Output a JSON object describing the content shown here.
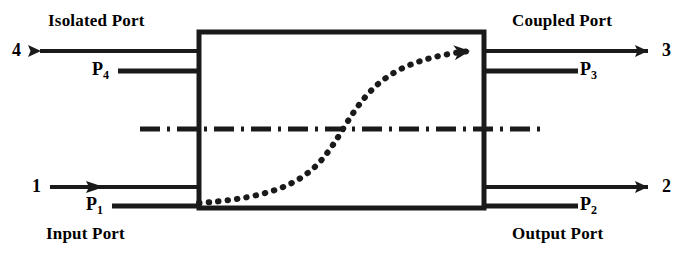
{
  "figure": {
    "colors": {
      "stroke": "#1a1a1a",
      "background": "#ffffff"
    }
  },
  "diagram": {
    "body_label": "coupler-body",
    "axis_label": "symmetry-axis",
    "coupling_label": "coupling-path"
  },
  "ports": {
    "isolated": {
      "name": "Isolated Port",
      "number": "4",
      "power": "P",
      "power_sub": "4"
    },
    "coupled": {
      "name": "Coupled Port",
      "number": "3",
      "power": "P",
      "power_sub": "3"
    },
    "input": {
      "name": "Input Port",
      "number": "1",
      "power": "P",
      "power_sub": "1"
    },
    "output": {
      "name": "Output Port",
      "number": "2",
      "power": "P",
      "power_sub": "2"
    }
  }
}
